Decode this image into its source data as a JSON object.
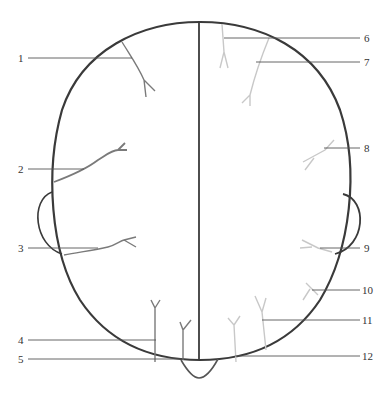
{
  "figure": {
    "type": "anatomical head diagram, superior (top) view",
    "labels": [
      {
        "id": "1",
        "text": "1",
        "x": 18,
        "y": 52,
        "line": [
          28,
          58,
          132,
          58
        ]
      },
      {
        "id": "2",
        "text": "2",
        "x": 18,
        "y": 164,
        "line": [
          28,
          169,
          84,
          169
        ]
      },
      {
        "id": "3",
        "text": "3",
        "x": 18,
        "y": 242,
        "line": [
          28,
          248,
          98,
          248
        ]
      },
      {
        "id": "4",
        "text": "4",
        "x": 18,
        "y": 334,
        "line": [
          28,
          340,
          156,
          340
        ]
      },
      {
        "id": "5",
        "text": "5",
        "x": 18,
        "y": 353,
        "line": [
          28,
          359,
          184,
          359
        ]
      },
      {
        "id": "6",
        "text": "6",
        "x": 364,
        "y": 32,
        "line": [
          224,
          38,
          360,
          38
        ]
      },
      {
        "id": "7",
        "text": "7",
        "x": 364,
        "y": 56,
        "line": [
          256,
          62,
          360,
          62
        ]
      },
      {
        "id": "8",
        "text": "8",
        "x": 364,
        "y": 142,
        "line": [
          324,
          148,
          360,
          148
        ]
      },
      {
        "id": "9",
        "text": "9",
        "x": 364,
        "y": 242,
        "line": [
          320,
          248,
          360,
          248
        ]
      },
      {
        "id": "10",
        "text": "10",
        "x": 362,
        "y": 284,
        "line": [
          312,
          290,
          360,
          290
        ]
      },
      {
        "id": "11",
        "text": "11",
        "x": 362,
        "y": 315,
        "line": [
          262,
          320,
          360,
          320
        ]
      },
      {
        "id": "12",
        "text": "12",
        "x": 362,
        "y": 350,
        "line": [
          235,
          356,
          360,
          356
        ]
      }
    ],
    "colors": {
      "outline": "#3a3a3a",
      "midline": "#3a3a3a",
      "left_vessels": "#7a7a7a",
      "right_vessels": "#c8c8c8",
      "leader_lines": "#555555",
      "label_text": "#333333"
    }
  }
}
